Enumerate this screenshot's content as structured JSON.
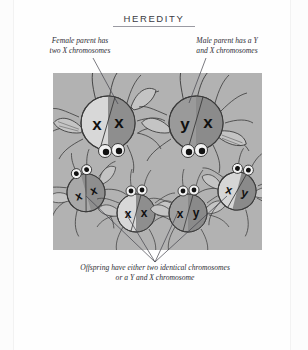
{
  "title": "HEREDITY",
  "captions": {
    "female_parent": "Female parent has\ntwo X chromosomes",
    "male_parent": "Male parent has a Y\nand X chromosomes",
    "offspring": "Offspring have either two identical chromosomes\nor a Y and X chromosome"
  },
  "colors": {
    "page_background": "#fcfcfc",
    "panel_background": "#b2b2b2",
    "body_light": "#d8d8d8",
    "body_dark": "#8e8e8e",
    "body_mid": "#a0a0a0",
    "outline": "#3a3a3a",
    "text": "#2e2e36",
    "title": "#3a3a44",
    "leader_line": "#42424a"
  },
  "diagram": {
    "type": "punnett-cross-illustration",
    "parents": [
      {
        "id": "female-parent",
        "role": "female",
        "chromosomes": [
          "x",
          "x"
        ],
        "left_half": "light",
        "right_half": "dark"
      },
      {
        "id": "male-parent",
        "role": "male",
        "chromosomes": [
          "y",
          "x"
        ],
        "left_half": "dark",
        "right_half": "dark"
      }
    ],
    "offspring": [
      {
        "id": "offspring-1",
        "chromosomes": [
          "x",
          "x"
        ]
      },
      {
        "id": "offspring-2",
        "chromosomes": [
          "x",
          "x"
        ]
      },
      {
        "id": "offspring-3",
        "chromosomes": [
          "x",
          "y"
        ]
      },
      {
        "id": "offspring-4",
        "chromosomes": [
          "x",
          "y"
        ]
      }
    ],
    "offspring_count": 4,
    "convergence_point": {
      "x": 155,
      "y": 262
    }
  }
}
